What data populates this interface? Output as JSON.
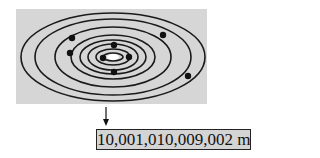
{
  "diagram": {
    "panel_color": "#d6d6d6",
    "sun_color": "#ffffff",
    "orbit_color": "#1a1a1a",
    "center": [
      113,
      57
    ],
    "orbits": [
      {
        "rx": 10,
        "ry": 4
      },
      {
        "rx": 17,
        "ry": 8
      },
      {
        "rx": 25,
        "ry": 13
      },
      {
        "rx": 33,
        "ry": 17
      },
      {
        "rx": 42,
        "ry": 22
      },
      {
        "rx": 58,
        "ry": 30
      },
      {
        "rx": 78,
        "ry": 38
      },
      {
        "rx": 92,
        "ry": 44
      }
    ],
    "planets": [
      {
        "cx": 103,
        "cy": 58
      },
      {
        "cx": 129,
        "cy": 57
      },
      {
        "cx": 114,
        "cy": 45
      },
      {
        "cx": 114,
        "cy": 72
      },
      {
        "cx": 70,
        "cy": 53
      },
      {
        "cx": 72,
        "cy": 38
      },
      {
        "cx": 163,
        "cy": 35
      },
      {
        "cx": 188,
        "cy": 76
      }
    ],
    "arrow": {
      "x": 106,
      "y1": 107,
      "y2": 126
    }
  },
  "label": {
    "value": "10,001,010,009,002 m"
  }
}
